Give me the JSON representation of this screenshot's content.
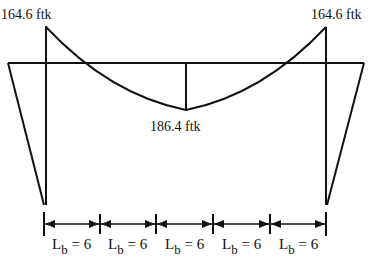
{
  "diagram": {
    "colors": {
      "stroke": "#111111",
      "background": "#ffffff"
    },
    "moment_labels": [
      {
        "id": "left-end",
        "text": "164.6 ftk"
      },
      {
        "id": "right-end",
        "text": "164.6 ftk"
      },
      {
        "id": "midspan",
        "text": "186.4 ftk"
      }
    ],
    "segments": [
      {
        "main": "L",
        "sub": "b",
        "rest": " = 6"
      },
      {
        "main": "L",
        "sub": "b",
        "rest": " = 6"
      },
      {
        "main": "L",
        "sub": "b",
        "rest": " = 6"
      },
      {
        "main": "L",
        "sub": "b",
        "rest": " = 6"
      },
      {
        "main": "L",
        "sub": "b",
        "rest": " = 6"
      }
    ]
  }
}
